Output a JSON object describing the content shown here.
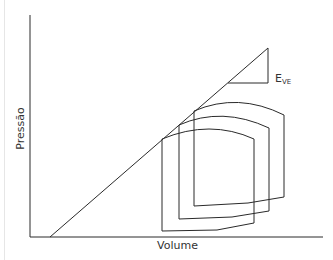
{
  "diagram": {
    "type": "pressure-volume-loops",
    "x_axis_label": "Volume",
    "y_axis_label": "Pressão",
    "elastance_label_main": "E",
    "elastance_label_sub": "VE",
    "colors": {
      "line": "#2a2a2a",
      "text": "#333333"
    },
    "loops": [
      {
        "name": "loop-large-preload",
        "points": "194,111 212,104 238,100 260,106 284,115 284,197 248,203 194,206"
      },
      {
        "name": "loop-medium-preload",
        "points": "179,125 196,118 213,113 240,117 269,128 269,211 232,217 179,219"
      },
      {
        "name": "loop-small-preload",
        "points": "162,139 185,130 208,126 232,130 254,139 254,223 217,230 162,231"
      }
    ]
  }
}
